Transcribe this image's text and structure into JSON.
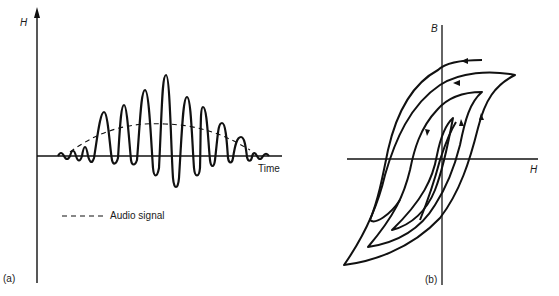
{
  "panel_a": {
    "label": "(a)",
    "y_axis_label": "H",
    "x_axis_label": "Time",
    "legend": {
      "line_style": "dashed",
      "label": "Audio signal"
    },
    "waveform": {
      "peaks": [
        [
          71,
          143
        ],
        [
          87,
          131
        ],
        [
          104,
          113
        ],
        [
          123,
          105
        ],
        [
          145,
          90
        ],
        [
          166,
          75
        ],
        [
          187,
          97
        ],
        [
          203,
          107
        ],
        [
          222,
          123
        ],
        [
          241,
          137
        ]
      ],
      "troughs": [
        [
          80,
          160
        ],
        [
          95,
          163
        ],
        [
          114,
          162
        ],
        [
          134,
          162
        ],
        [
          155,
          176
        ],
        [
          176,
          188
        ],
        [
          196,
          178
        ],
        [
          213,
          167
        ],
        [
          232,
          164
        ],
        [
          250,
          160
        ]
      ]
    }
  },
  "panel_b": {
    "label": "(b)",
    "y_axis_label": "B",
    "x_axis_label": "H",
    "loops": [
      "outer",
      "middle",
      "inner",
      "innermost"
    ]
  },
  "colors": {
    "ink": "#111111",
    "background": "#ffffff"
  }
}
